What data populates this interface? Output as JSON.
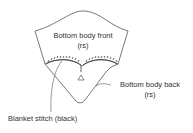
{
  "diagram": {
    "front_label": "Bottom body front",
    "front_sub": "(rs)",
    "back_label": "Bottom body back",
    "back_sub": "(rs)",
    "stitch_label": "Blanket stitch (black)",
    "colors": {
      "line": "#555555",
      "stitch": "#222222",
      "text": "#333333"
    }
  }
}
